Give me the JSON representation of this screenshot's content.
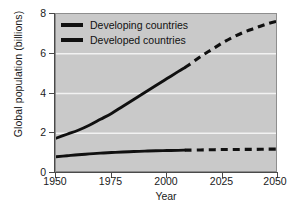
{
  "chart_data": {
    "type": "line",
    "title": "",
    "xlabel": "Year",
    "ylabel": "Global population (billions)",
    "xlim": [
      1950,
      2050
    ],
    "ylim": [
      0,
      8
    ],
    "xticks": [
      "1950",
      "1975",
      "2000",
      "2025",
      "2050"
    ],
    "yticks": [
      "0",
      "2",
      "4",
      "6",
      "8"
    ],
    "grid": true,
    "grid_color": "#f2f2f2",
    "plot_background": "#c9c9c9",
    "line_color": "#101010",
    "projection_start_year": 2008,
    "legend_position": "top-left",
    "series": [
      {
        "name": "Developing countries",
        "style": "solid-then-dashed",
        "x": [
          1950,
          1955,
          1960,
          1965,
          1970,
          1975,
          1980,
          1985,
          1990,
          1995,
          2000,
          2005,
          2008,
          2010,
          2015,
          2020,
          2025,
          2030,
          2035,
          2040,
          2045,
          2050
        ],
        "values": [
          1.75,
          1.95,
          2.15,
          2.4,
          2.7,
          3.0,
          3.35,
          3.7,
          4.05,
          4.4,
          4.75,
          5.1,
          5.3,
          5.45,
          5.85,
          6.2,
          6.55,
          6.85,
          7.1,
          7.3,
          7.5,
          7.65
        ]
      },
      {
        "name": "Developed countries",
        "style": "solid-then-dashed",
        "x": [
          1950,
          1955,
          1960,
          1965,
          1970,
          1975,
          1980,
          1985,
          1990,
          1995,
          2000,
          2005,
          2008,
          2010,
          2015,
          2020,
          2025,
          2030,
          2035,
          2040,
          2045,
          2050
        ],
        "values": [
          0.82,
          0.87,
          0.92,
          0.96,
          1.0,
          1.03,
          1.06,
          1.08,
          1.1,
          1.12,
          1.13,
          1.14,
          1.15,
          1.15,
          1.16,
          1.17,
          1.18,
          1.18,
          1.19,
          1.19,
          1.2,
          1.2
        ]
      }
    ]
  },
  "legend": {
    "items": [
      {
        "label": "Developing countries"
      },
      {
        "label": "Developed countries"
      }
    ]
  }
}
